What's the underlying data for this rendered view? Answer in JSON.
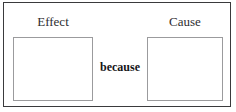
{
  "diagram": {
    "type": "cause-and-effect-frame",
    "frame": {
      "border_color": "#3a3a3c",
      "background_color": "#ffffff"
    },
    "slots": [
      {
        "id": "effect",
        "label": "Effect",
        "value": "",
        "border_color": "#9b9b9d",
        "fill_color": "#ffffff"
      },
      {
        "id": "cause",
        "label": "Cause",
        "value": "",
        "border_color": "#9b9b9d",
        "fill_color": "#ffffff"
      }
    ],
    "connector": {
      "label": "because",
      "color": "#151517"
    }
  }
}
